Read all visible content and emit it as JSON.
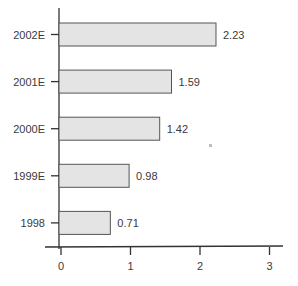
{
  "chart_data": {
    "type": "bar",
    "orientation": "horizontal",
    "title": "",
    "xlabel": "",
    "ylabel": "",
    "categories": [
      "2002E",
      "2001E",
      "2000E",
      "1999E",
      "1998"
    ],
    "values": [
      2.23,
      1.59,
      1.42,
      0.98,
      0.71
    ],
    "value_labels": [
      "2.23",
      "1.59",
      "1.42",
      "0.98",
      "0.71"
    ],
    "xlim": [
      0,
      3.15
    ],
    "x_ticks": [
      0,
      1,
      2,
      3
    ],
    "x_tick_labels": [
      "0",
      "1",
      "2",
      "3"
    ],
    "grid": false,
    "legend": "none",
    "bar_color": "#e4e4e4",
    "bar_edge_color": "#555555"
  }
}
